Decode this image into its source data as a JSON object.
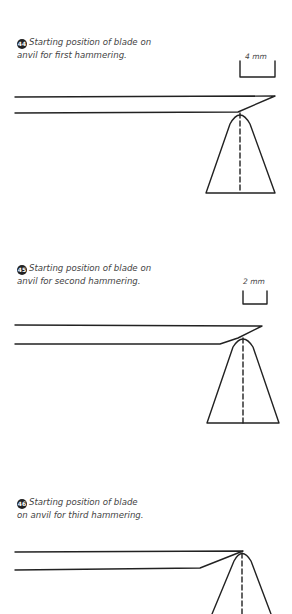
{
  "figures": [
    {
      "number": "44",
      "caption_line1": "Starting position of blade on",
      "caption_line2": "anvil for first hammering.",
      "scale_label": "4 mm"
    },
    {
      "number": "45",
      "caption_line1": "Starting position of blade on",
      "caption_line2": "anvil for second hammering.",
      "scale_label": "2 mm"
    },
    {
      "number": "46",
      "caption_line1": "Starting position of blade",
      "caption_line2": "on anvil for third hammering.",
      "scale_label": ""
    }
  ],
  "colors": {
    "line": "#222222",
    "text": "#444444",
    "background": "#ffffff"
  }
}
